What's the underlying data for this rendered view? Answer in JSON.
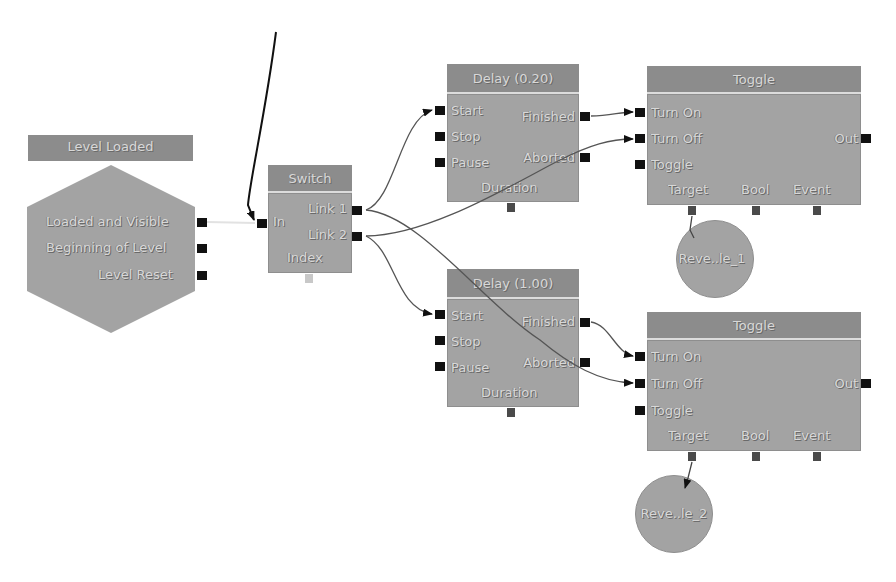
{
  "canvas": {
    "background": "#ffffff",
    "node_body_color": "#a3a3a3",
    "node_title_color": "#8c8c8c",
    "port_color": "#111111"
  },
  "event_node": {
    "title": "Level Loaded",
    "outputs": [
      "Loaded and Visible",
      "Beginning of Level",
      "Level Reset"
    ]
  },
  "switch_node": {
    "title": "Switch",
    "inputs": [
      "In"
    ],
    "outputs": [
      "Link 1",
      "Link 2"
    ],
    "variables": [
      "Index"
    ]
  },
  "delay_nodes": [
    {
      "title": "Delay (0.20)",
      "inputs": [
        "Start",
        "Stop",
        "Pause"
      ],
      "outputs": [
        "Finished",
        "Aborted"
      ],
      "variables": [
        "Duration"
      ]
    },
    {
      "title": "Delay (1.00)",
      "inputs": [
        "Start",
        "Stop",
        "Pause"
      ],
      "outputs": [
        "Finished",
        "Aborted"
      ],
      "variables": [
        "Duration"
      ]
    }
  ],
  "toggle_nodes": [
    {
      "title": "Toggle",
      "inputs": [
        "Turn On",
        "Turn Off",
        "Toggle"
      ],
      "outputs": [
        "Out"
      ],
      "variables": [
        "Target",
        "Bool",
        "Event"
      ]
    },
    {
      "title": "Toggle",
      "inputs": [
        "Turn On",
        "Turn Off",
        "Toggle"
      ],
      "outputs": [
        "Out"
      ],
      "variables": [
        "Target",
        "Bool",
        "Event"
      ]
    }
  ],
  "variable_nodes": [
    {
      "label": "Reve..le_1"
    },
    {
      "label": "Reve..le_2"
    }
  ],
  "connections": [
    {
      "from": "Level Loaded.Loaded and Visible",
      "to": "Switch.In"
    },
    {
      "from": "(offscreen)",
      "to": "Switch.In"
    },
    {
      "from": "Switch.Link 1",
      "to": "Delay (0.20).Start"
    },
    {
      "from": "Switch.Link 1",
      "to": "Toggle 2.Turn Off"
    },
    {
      "from": "Switch.Link 2",
      "to": "Toggle 1.Turn Off"
    },
    {
      "from": "Switch.Link 2",
      "to": "Delay (1.00).Start"
    },
    {
      "from": "Delay (0.20).Finished",
      "to": "Toggle 1.Turn On"
    },
    {
      "from": "Delay (1.00).Finished",
      "to": "Toggle 2.Turn On"
    },
    {
      "from": "Toggle 1.Target",
      "to": "Reve..le_1"
    },
    {
      "from": "Toggle 2.Target",
      "to": "Reve..le_2"
    }
  ]
}
